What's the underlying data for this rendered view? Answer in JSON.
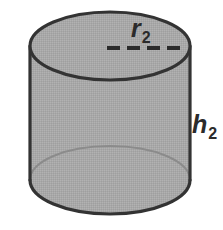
{
  "figure": {
    "name": "cylinder-diagram",
    "shape": "cylinder",
    "background_color": "#ffffff",
    "fill_color": "#a8a8a8",
    "outline_color": "#333333",
    "hidden_edge_color": "#8b8b8b",
    "label_color": "#2b2b2b"
  },
  "labels": {
    "radius": {
      "base": "r",
      "subscript": "2",
      "full": "r2",
      "position": "above-dashed-radius-line"
    },
    "height": {
      "base": "h",
      "subscript": "2",
      "full": "h2",
      "position": "right-of-cylinder-side"
    }
  },
  "geometry": {
    "top_ellipse": {
      "cx": 110,
      "cy": 46,
      "rx": 80,
      "ry": 34
    },
    "bottom_ellipse": {
      "cx": 110,
      "cy": 180,
      "rx": 80,
      "ry": 34
    },
    "side_left_x": 30,
    "side_right_x": 190,
    "radius_line": {
      "x1": 107,
      "y1": 48,
      "x2": 187,
      "y2": 48,
      "style": "dashed"
    }
  }
}
